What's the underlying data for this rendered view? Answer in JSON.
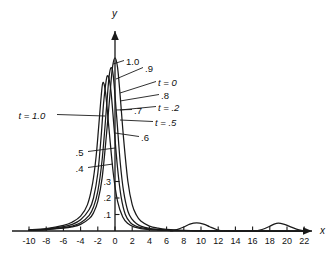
{
  "figure": {
    "background": "#ffffff",
    "curve_color": "#1a1a1a",
    "axis_color": "#1a1a1a"
  },
  "axes": {
    "x_name": "x",
    "y_name": "y",
    "x_ticks": [
      "-10",
      "-8",
      "-6",
      "-4",
      "-2",
      "0",
      "2",
      "4",
      "6",
      "8",
      "10",
      "12",
      "14",
      "16",
      "18",
      "20",
      "22"
    ],
    "x_tick_values": [
      -10,
      -8,
      -6,
      -4,
      -2,
      0,
      2,
      4,
      6,
      8,
      10,
      12,
      14,
      16,
      18,
      20,
      22
    ],
    "y_ticks": [
      ".1",
      ".2",
      ".3"
    ],
    "y_tick_values": [
      0.1,
      0.2,
      0.3
    ]
  },
  "annotations": {
    "amplitude_labels": [
      "1.0",
      ".9",
      ".8",
      ".7",
      ".6",
      ".5",
      ".4"
    ],
    "time_labels": [
      "t = 0",
      "t = .2",
      "t = .5",
      "t = 1.0"
    ],
    "callouts": [
      {
        "text": "1.0",
        "kind": "amplitude",
        "lx": 124,
        "ly": 57,
        "tx": 113,
        "ty": 64
      },
      {
        "text": ".9",
        "kind": "amplitude",
        "lx": 143,
        "ly": 64,
        "tx": 116,
        "ty": 79
      },
      {
        "text": "t = 0",
        "kind": "time",
        "lx": 156,
        "ly": 78,
        "tx": 120,
        "ty": 93
      },
      {
        "text": ".8",
        "kind": "amplitude",
        "lx": 159,
        "ly": 91,
        "tx": 120,
        "ty": 101
      },
      {
        "text": "t = .2",
        "kind": "time",
        "lx": 156,
        "ly": 103,
        "tx": 120,
        "ty": 110
      },
      {
        "text": ".7",
        "kind": "amplitude",
        "lx": 132,
        "ly": 106,
        "tx": 116,
        "ty": 110
      },
      {
        "text": "t = .5",
        "kind": "time",
        "lx": 153,
        "ly": 118,
        "tx": 120,
        "ty": 120
      },
      {
        "text": ".6",
        "kind": "amplitude",
        "lx": 139,
        "ly": 133,
        "tx": 115,
        "ty": 133
      },
      {
        "text": "t = 1.0",
        "kind": "time",
        "lx": 57,
        "ly": 111,
        "tx": 105,
        "ty": 116
      },
      {
        "text": ".5",
        "kind": "amplitude",
        "lx": 88,
        "ly": 148,
        "tx": 115,
        "ty": 148
      },
      {
        "text": ".4",
        "kind": "amplitude",
        "lx": 88,
        "ly": 164,
        "tx": 113,
        "ty": 164
      }
    ]
  },
  "chart_data": {
    "type": "line",
    "title": "",
    "xlabel": "x",
    "ylabel": "y",
    "xlim": [
      -11,
      23.5
    ],
    "ylim": [
      0,
      1.12
    ],
    "grid": false,
    "legend": "inline-callouts",
    "x_ticks": [
      -10,
      -8,
      -6,
      -4,
      -2,
      0,
      2,
      4,
      6,
      8,
      10,
      12,
      14,
      16,
      18,
      20,
      22
    ],
    "y_ticks": [
      0.1,
      0.2,
      0.3
    ],
    "series": [
      {
        "name": "t = 0",
        "peak_x": 0.0,
        "peak_y": 1.05,
        "half_width": 1.1,
        "color": "#1a1a1a",
        "points_x": [
          -10,
          -8,
          -6,
          -5,
          -4,
          -3,
          -2.5,
          -2,
          -1.5,
          -1,
          -0.6,
          -0.3,
          0,
          0.3,
          0.6,
          1,
          1.5,
          2,
          2.5,
          3,
          4,
          5,
          6,
          8,
          10,
          14,
          18,
          22
        ],
        "points_y": [
          0.004,
          0.008,
          0.017,
          0.025,
          0.04,
          0.075,
          0.11,
          0.18,
          0.32,
          0.58,
          0.82,
          0.99,
          1.05,
          0.99,
          0.82,
          0.56,
          0.3,
          0.16,
          0.095,
          0.06,
          0.03,
          0.017,
          0.01,
          0.004,
          0.002,
          0.001,
          0.0,
          0.0
        ]
      },
      {
        "name": "t = .2",
        "peak_x": -0.45,
        "peak_y": 0.99,
        "half_width": 1.1,
        "color": "#1a1a1a",
        "points_x": [
          -10,
          -8,
          -6,
          -5,
          -4,
          -3,
          -2.5,
          -2,
          -1.5,
          -1,
          -0.7,
          -0.45,
          -0.2,
          0.2,
          0.6,
          1,
          1.5,
          2,
          2.5,
          3,
          4,
          5,
          6,
          8,
          10,
          14,
          18,
          22
        ],
        "points_y": [
          0.005,
          0.009,
          0.02,
          0.03,
          0.05,
          0.095,
          0.145,
          0.24,
          0.43,
          0.74,
          0.93,
          0.99,
          0.94,
          0.69,
          0.42,
          0.24,
          0.12,
          0.07,
          0.045,
          0.03,
          0.016,
          0.01,
          0.006,
          0.003,
          0.002,
          0.001,
          0.0,
          0.0
        ]
      },
      {
        "name": "t = .5",
        "peak_x": -0.9,
        "peak_y": 0.94,
        "half_width": 1.0,
        "color": "#1a1a1a",
        "points_x": [
          -10,
          -8,
          -6,
          -5,
          -4,
          -3,
          -2.5,
          -2,
          -1.6,
          -1.3,
          -0.9,
          -0.5,
          -0.1,
          0.3,
          0.7,
          1.2,
          1.8,
          2.4,
          3,
          4,
          5,
          6,
          8,
          10,
          14,
          18,
          22
        ],
        "points_y": [
          0.006,
          0.012,
          0.026,
          0.04,
          0.068,
          0.13,
          0.2,
          0.35,
          0.58,
          0.79,
          0.94,
          0.86,
          0.62,
          0.38,
          0.21,
          0.1,
          0.05,
          0.03,
          0.02,
          0.011,
          0.007,
          0.004,
          0.002,
          0.001,
          0.0,
          0.0,
          0.0
        ]
      },
      {
        "name": "t = 1.0",
        "peak_x": -1.4,
        "peak_y": 0.9,
        "half_width": 0.95,
        "color": "#1a1a1a",
        "points_x": [
          -10,
          -8,
          -6,
          -5,
          -4,
          -3.2,
          -2.6,
          -2.2,
          -1.9,
          -1.6,
          -1.4,
          -1.1,
          -0.7,
          -0.2,
          0.3,
          0.9,
          1.5,
          2.2,
          3,
          4,
          5,
          6,
          8,
          10,
          14,
          18,
          22
        ],
        "points_y": [
          0.007,
          0.015,
          0.034,
          0.053,
          0.09,
          0.16,
          0.29,
          0.45,
          0.63,
          0.82,
          0.9,
          0.84,
          0.62,
          0.35,
          0.18,
          0.085,
          0.045,
          0.025,
          0.015,
          0.009,
          0.006,
          0.004,
          0.002,
          0.001,
          0.0,
          0.0,
          0.0
        ]
      },
      {
        "name": "secondary-hump-1",
        "peak_x": 9.5,
        "peak_y": 0.05,
        "half_width": 1.7,
        "color": "#1a1a1a",
        "points_x": [
          6.5,
          7.2,
          8,
          8.7,
          9.5,
          10.3,
          11,
          11.8,
          12.5
        ],
        "points_y": [
          0.0,
          0.008,
          0.024,
          0.042,
          0.05,
          0.042,
          0.026,
          0.009,
          0.0
        ]
      },
      {
        "name": "secondary-hump-2",
        "peak_x": 19.0,
        "peak_y": 0.048,
        "half_width": 1.9,
        "color": "#1a1a1a",
        "points_x": [
          16.3,
          17.1,
          17.9,
          18.5,
          19,
          19.6,
          20.3,
          21.1,
          22
        ],
        "points_y": [
          0.0,
          0.009,
          0.026,
          0.042,
          0.048,
          0.042,
          0.028,
          0.011,
          0.0
        ]
      }
    ]
  }
}
